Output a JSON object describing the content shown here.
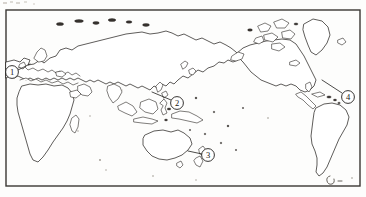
{
  "figure": {
    "kind": "world-outline-map",
    "projection_note": "Pacific-centered world outline map, scanned line art",
    "frame": {
      "x": 6,
      "y": 10,
      "width": 354,
      "height": 176
    },
    "canvas": {
      "width": 366,
      "height": 197
    },
    "colors": {
      "coastline": "#2a2724",
      "frame": "#3a3734",
      "marker_text": "#151310",
      "paper": "#fdfdfc",
      "islet": "#35312d"
    }
  },
  "markers": [
    {
      "id": "marker-1",
      "label": "①",
      "number": "1",
      "cx": 12,
      "cy": 72,
      "r": 6.4,
      "region": "western-europe",
      "leader": {
        "x1": 18,
        "y1": 70,
        "x2": 30,
        "y2": 64
      }
    },
    {
      "id": "marker-2",
      "label": "②",
      "number": "2",
      "cx": 177,
      "cy": 103,
      "r": 6.4,
      "region": "western-pacific-philippines",
      "leader": {
        "x1": 171,
        "y1": 100,
        "x2": 152,
        "y2": 92
      }
    },
    {
      "id": "marker-3",
      "label": "③",
      "number": "3",
      "cx": 208,
      "cy": 155,
      "r": 6.4,
      "region": "new-zealand",
      "leader": {
        "x1": 202,
        "y1": 154,
        "x2": 188,
        "y2": 151
      }
    },
    {
      "id": "marker-4",
      "label": "④",
      "number": "4",
      "cx": 348,
      "cy": 97,
      "r": 6.4,
      "region": "north-atlantic-east-of-north-america",
      "leader": {
        "x1": 342,
        "y1": 93,
        "x2": 322,
        "y2": 80
      }
    }
  ],
  "landmasses": [
    {
      "name": "eurasia",
      "label": "Eurasia"
    },
    {
      "name": "africa",
      "label": "Africa"
    },
    {
      "name": "madagascar",
      "label": "Madagascar"
    },
    {
      "name": "maritime-southeast-asia",
      "label": "Maritime Southeast Asia"
    },
    {
      "name": "australia",
      "label": "Australia"
    },
    {
      "name": "tasmania",
      "label": "Tasmania"
    },
    {
      "name": "new-zealand",
      "label": "New Zealand"
    },
    {
      "name": "north-america",
      "label": "North America"
    },
    {
      "name": "greenland",
      "label": "Greenland"
    },
    {
      "name": "canadian-arctic-archipelago",
      "label": "Canadian Arctic Archipelago"
    },
    {
      "name": "central-america",
      "label": "Central America"
    },
    {
      "name": "south-america",
      "label": "South America"
    },
    {
      "name": "japan",
      "label": "Japan"
    },
    {
      "name": "british-isles",
      "label": "British Isles"
    },
    {
      "name": "arctic-islands",
      "label": "Arctic Islands"
    }
  ]
}
